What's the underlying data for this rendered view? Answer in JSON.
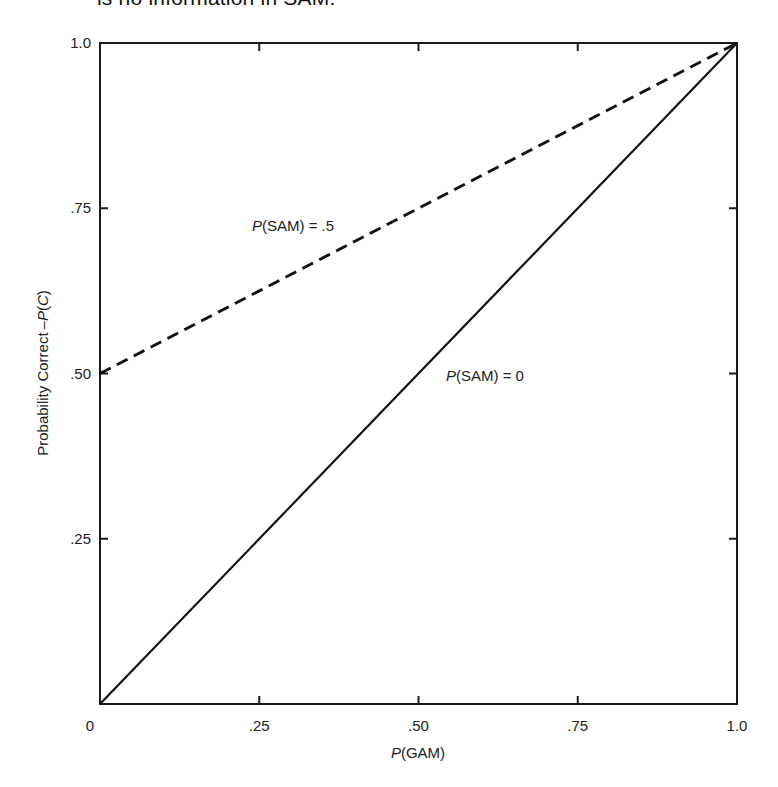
{
  "caption": "is no information in SAM.",
  "chart_data": {
    "type": "line",
    "title": "",
    "xlabel_italic": "P",
    "xlabel_rest": "(GAM)",
    "xlabel": "P(GAM)",
    "ylabel_prefix": "Probability Correct –",
    "ylabel_p": "P",
    "ylabel_open": "(",
    "ylabel_c": "C",
    "ylabel_close": ")",
    "ylabel": "Probability Correct – P(C)",
    "xlim": [
      0,
      1.0
    ],
    "ylim": [
      0,
      1.0
    ],
    "grid": false,
    "x_ticks": [
      {
        "value": 0,
        "label": "0"
      },
      {
        "value": 0.25,
        "label": ".25"
      },
      {
        "value": 0.5,
        "label": ".50"
      },
      {
        "value": 0.75,
        "label": ".75"
      },
      {
        "value": 1.0,
        "label": "1.0"
      }
    ],
    "y_ticks": [
      {
        "value": 0,
        "label": "0"
      },
      {
        "value": 0.25,
        "label": ".25"
      },
      {
        "value": 0.5,
        "label": ".50"
      },
      {
        "value": 0.75,
        "label": ".75"
      },
      {
        "value": 1.0,
        "label": "1.0"
      }
    ],
    "series": [
      {
        "name": "P(SAM) = .5",
        "label_italic": "P",
        "label_rest": "(SAM) = .5",
        "style": "dashed",
        "x": [
          0,
          0.25,
          0.5,
          0.75,
          1.0
        ],
        "y": [
          0.5,
          0.625,
          0.75,
          0.875,
          1.0
        ]
      },
      {
        "name": "P(SAM) = 0",
        "label_italic": "P",
        "label_rest": "(SAM) = 0",
        "style": "solid",
        "x": [
          0,
          0.25,
          0.5,
          0.75,
          1.0
        ],
        "y": [
          0,
          0.25,
          0.5,
          0.75,
          1.0
        ]
      }
    ],
    "annotations": [
      {
        "text": "P(SAM) = .5",
        "x": 0.25,
        "y": 0.72
      },
      {
        "text": "P(SAM) = 0",
        "x": 0.55,
        "y": 0.49
      }
    ]
  }
}
